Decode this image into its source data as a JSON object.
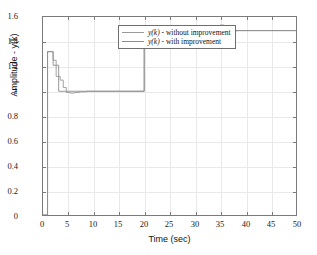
{
  "chart_data": {
    "type": "line",
    "title": "",
    "xlabel": "Time (sec)",
    "ylabel": "Amplitude - y(k)",
    "xlim": [
      0,
      50
    ],
    "ylim": [
      0,
      1.6
    ],
    "xticks": [
      "0",
      "5",
      "10",
      "15",
      "20",
      "25",
      "30",
      "35",
      "40",
      "45",
      "50"
    ],
    "yticks": [
      "0",
      "0.2",
      "0.4",
      "0.6",
      "0.8",
      "1",
      "1.2",
      "1.4",
      "1.6"
    ],
    "grid": true,
    "legend_position": "upper-center",
    "series": [
      {
        "name": "y(k) - without improvement",
        "color": "#9a9a9a",
        "points": [
          [
            0.0,
            0.0
          ],
          [
            0.9,
            0.0
          ],
          [
            0.9,
            1.32
          ],
          [
            2.0,
            1.32
          ],
          [
            2.0,
            1.25
          ],
          [
            2.6,
            1.25
          ],
          [
            2.6,
            1.12
          ],
          [
            3.4,
            1.12
          ],
          [
            3.4,
            1.09
          ],
          [
            4.0,
            1.09
          ],
          [
            4.0,
            1.03
          ],
          [
            4.6,
            1.03
          ],
          [
            4.6,
            0.99
          ],
          [
            5.4,
            0.99
          ],
          [
            5.4,
            0.985
          ],
          [
            6.2,
            0.985
          ],
          [
            6.2,
            0.99
          ],
          [
            7.2,
            0.99
          ],
          [
            7.2,
            0.995
          ],
          [
            8.6,
            0.995
          ],
          [
            8.6,
            1.0
          ],
          [
            20.0,
            1.0
          ],
          [
            20.0,
            1.385
          ],
          [
            21.0,
            1.385
          ],
          [
            21.0,
            1.425
          ],
          [
            21.8,
            1.425
          ],
          [
            21.8,
            1.45
          ],
          [
            22.6,
            1.45
          ],
          [
            22.6,
            1.462
          ],
          [
            23.4,
            1.462
          ],
          [
            23.4,
            1.472
          ],
          [
            24.4,
            1.472
          ],
          [
            24.4,
            1.482
          ],
          [
            25.6,
            1.482
          ],
          [
            25.6,
            1.49
          ],
          [
            35.0,
            1.49
          ],
          [
            35.0,
            1.535
          ],
          [
            35.8,
            1.535
          ],
          [
            35.8,
            1.465
          ],
          [
            36.8,
            1.465
          ],
          [
            36.8,
            1.485
          ],
          [
            38.2,
            1.485
          ],
          [
            38.2,
            1.49
          ],
          [
            50.0,
            1.49
          ]
        ]
      },
      {
        "name": "y(k) - with improvement",
        "color": "#8c8c8c",
        "points": [
          [
            0.0,
            0.0
          ],
          [
            0.9,
            0.0
          ],
          [
            0.9,
            1.32
          ],
          [
            2.0,
            1.32
          ],
          [
            2.0,
            1.21
          ],
          [
            3.1,
            1.21
          ],
          [
            3.1,
            1.0
          ],
          [
            20.0,
            1.0
          ],
          [
            20.0,
            1.49
          ],
          [
            50.0,
            1.49
          ]
        ]
      }
    ],
    "annotations": {
      "reference_final": 1.49,
      "reference_initial": 1.0
    }
  },
  "legend": {
    "items": [
      {
        "label_prefix": "y(k)",
        "label_suffix": " - without improvement"
      },
      {
        "label_prefix": "y(k)",
        "label_suffix": " - with improvement"
      }
    ]
  }
}
